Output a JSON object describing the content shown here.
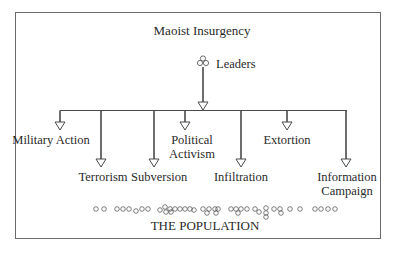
{
  "title": "Maoist Insurgency",
  "leaders": {
    "label": "Leaders",
    "icon": "group-of-circles-icon"
  },
  "branches": [
    {
      "id": "military-action",
      "label": "Military Action",
      "lines": [
        "Military Action"
      ]
    },
    {
      "id": "terrorism",
      "label": "Terrorism",
      "lines": [
        "Terrorism"
      ]
    },
    {
      "id": "subversion",
      "label": "Subversion",
      "lines": [
        "Subversion"
      ]
    },
    {
      "id": "political-activism",
      "label": "Political Activism",
      "lines": [
        "Political",
        "Activism"
      ]
    },
    {
      "id": "infiltration",
      "label": "Infiltration",
      "lines": [
        "Infiltration"
      ]
    },
    {
      "id": "extortion",
      "label": "Extortion",
      "lines": [
        "Extortion"
      ]
    },
    {
      "id": "information-campaign",
      "label": "Information Campaign",
      "lines": [
        "Information",
        "Campaign"
      ]
    }
  ],
  "population": {
    "label": "THE POPULATION",
    "icon": "population-circles-icon"
  },
  "colors": {
    "line": "#4a4a4a",
    "frame": "#6a6a6a",
    "text": "#2a2a2a"
  }
}
